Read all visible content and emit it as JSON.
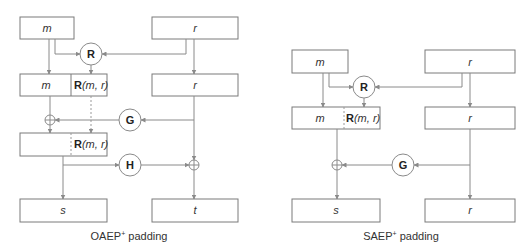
{
  "oaep": {
    "caption": "OAEP",
    "caption_sup": "+",
    "caption_tail": " padding",
    "top_left": "m",
    "top_right": "r",
    "row2_left": "m",
    "row2_func": "R",
    "row2_args": "(m, r)",
    "row2_right": "r",
    "row3_func": "R",
    "row3_args": "(m, r)",
    "bottom_left": "s",
    "bottom_right": "t",
    "op_r": "R",
    "op_g": "G",
    "op_h": "H"
  },
  "saep": {
    "caption": "SAEP",
    "caption_sup": "+",
    "caption_tail": " padding",
    "top_left": "m",
    "top_right": "r",
    "row2_left": "m",
    "row2_func": "R",
    "row2_args": "(m, r)",
    "row2_right": "r",
    "bottom_left": "s",
    "bottom_right": "r",
    "op_r": "R",
    "op_g": "G"
  }
}
